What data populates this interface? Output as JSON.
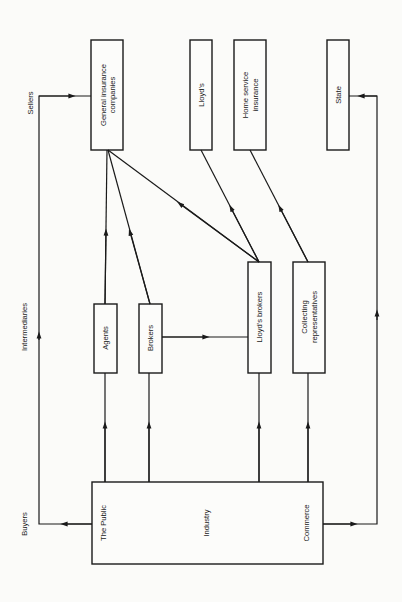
{
  "diagram": {
    "orientation": "rotated-90-ccw",
    "levels": {
      "sellers": "Sellers",
      "intermediaries": "Intermediaries",
      "buyers": "Buyers"
    },
    "sellers": {
      "general_insurance": [
        "General insurance",
        "companies"
      ],
      "lloyds": "Lloyd's",
      "home_service": [
        "Home service",
        "insurance"
      ],
      "state": "State"
    },
    "intermediaries": {
      "agents": "Agents",
      "brokers": "Brokers",
      "lloyds_brokers": "Lloyd's brokers",
      "collecting": [
        "Collecting",
        "representatives"
      ]
    },
    "buyers": {
      "public": "The Public",
      "industry": "Industry",
      "commerce": "Commerce"
    },
    "flows": [
      {
        "from": "Buyers",
        "to": "Agents"
      },
      {
        "from": "Buyers",
        "to": "Brokers"
      },
      {
        "from": "Buyers",
        "to": "Lloyd's brokers"
      },
      {
        "from": "Buyers",
        "to": "Collecting representatives"
      },
      {
        "from": "Buyers",
        "to": "General insurance companies",
        "route": "direct (left loop)"
      },
      {
        "from": "Buyers",
        "to": "State",
        "route": "direct (right loop)"
      },
      {
        "from": "Agents",
        "to": "General insurance companies"
      },
      {
        "from": "Brokers",
        "to": "General insurance companies"
      },
      {
        "from": "Brokers",
        "to": "Lloyd's brokers"
      },
      {
        "from": "Lloyd's brokers",
        "to": "General insurance companies"
      },
      {
        "from": "Lloyd's brokers",
        "to": "Lloyd's"
      },
      {
        "from": "Collecting representatives",
        "to": "Home service insurance"
      }
    ]
  }
}
